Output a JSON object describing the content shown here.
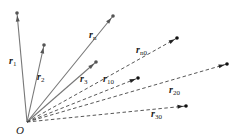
{
  "diagram": {
    "origin": {
      "label": "O",
      "x": 27,
      "y": 122
    },
    "solid_color": "#777777",
    "dashed_color": "#444444",
    "solid_vectors": [
      {
        "name": "r",
        "sub": "1",
        "end": [
          17,
          13
        ],
        "label_pos": [
          9,
          64
        ]
      },
      {
        "name": "r",
        "sub": "2",
        "end": [
          44,
          45
        ],
        "label_pos": [
          37,
          80
        ]
      },
      {
        "name": "r",
        "sub": "n",
        "end": [
          113,
          16
        ],
        "label_pos": [
          89,
          38
        ]
      },
      {
        "name": "r",
        "sub": "3",
        "end": [
          96,
          62
        ],
        "label_pos": [
          80,
          82
        ]
      }
    ],
    "dashed_vectors": [
      {
        "name": "r",
        "sub": "n0",
        "end": [
          177,
          38
        ],
        "label_pos": [
          136,
          53
        ]
      },
      {
        "name": "r",
        "sub": "10",
        "end": [
          138,
          78
        ],
        "label_pos": [
          103,
          82
        ]
      },
      {
        "name": "r",
        "sub": "20",
        "end": [
          227,
          64
        ],
        "label_pos": [
          169,
          93
        ]
      },
      {
        "name": "r",
        "sub": "30",
        "end": [
          186,
          106
        ],
        "label_pos": [
          151,
          117
        ]
      }
    ]
  }
}
